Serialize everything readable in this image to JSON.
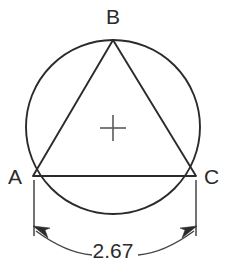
{
  "figure": {
    "type": "geometry-diagram",
    "background_color": "#ffffff",
    "line_color": "#2b2b2b",
    "thin_line_color": "#454545",
    "center_mark_color": "#5a5a5a"
  },
  "circle": {
    "name": "circumscribed-circle",
    "center_x": 113,
    "center_y": 127,
    "radius": 87
  },
  "center_mark": {
    "name": "center-cross",
    "x": 113,
    "y": 128,
    "arm_length": 13
  },
  "triangle": {
    "name": "inscribed-triangle",
    "vertices": [
      {
        "label": "B",
        "x": 113,
        "y": 40,
        "label_x": 113,
        "label_y": 24,
        "label_anchor": "middle"
      },
      {
        "label": "C",
        "x": 196,
        "y": 176,
        "label_x": 204,
        "label_y": 184,
        "label_anchor": "start"
      },
      {
        "label": "A",
        "x": 33,
        "y": 176,
        "label_x": 22,
        "label_y": 184,
        "label_anchor": "end"
      }
    ]
  },
  "dimension": {
    "name": "side-length-dimension",
    "value": "2.67",
    "text_x": 113,
    "text_y": 258,
    "extension_left_x": 34,
    "extension_right_x": 196,
    "extension_top_y": 180,
    "extension_bottom_y": 236,
    "arrow_left_x": 36,
    "arrow_left_y": 230,
    "arrow_right_x": 194,
    "arrow_right_y": 230,
    "arc_sag_y": 252
  },
  "labels": {
    "vertex_a": "A",
    "vertex_b": "B",
    "vertex_c": "C",
    "measurement": "2.67"
  }
}
